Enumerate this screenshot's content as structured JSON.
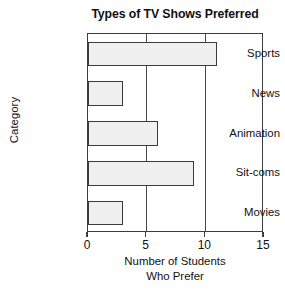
{
  "chart_data": {
    "type": "bar",
    "orientation": "horizontal",
    "title": "Types of TV Shows Preferred",
    "xlabel_line1": "Number of Students",
    "xlabel_line2": "Who Prefer",
    "ylabel": "Category",
    "categories": [
      "Sports",
      "News",
      "Animation",
      "Sit-coms",
      "Movies"
    ],
    "values": [
      11,
      3,
      6,
      9,
      3
    ],
    "xlim": [
      0,
      15
    ],
    "xticks": [
      0,
      5,
      10,
      15
    ],
    "xtick_labels": [
      "0",
      "5",
      "10",
      "15"
    ],
    "gridlines": [
      5,
      10
    ],
    "grid": true,
    "legend": "none",
    "bar_fill_color": "#f0f0f0",
    "bar_edge_color": "#3a3a3a",
    "axis_color": "#3c3c3c",
    "background_color": "#ffffff"
  }
}
